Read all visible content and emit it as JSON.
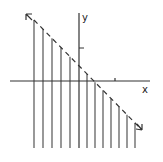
{
  "figure": {
    "type": "inequality-graph",
    "x_axis_label": "x",
    "y_axis_label": "y",
    "boundary": {
      "style": "dashed",
      "slope": -1,
      "arrows": "both ends"
    },
    "shading": "below line (vertical hatching)",
    "ticks": {
      "x": [
        1
      ],
      "y": [
        1
      ]
    },
    "colors": {
      "ink": "#333333",
      "background": "#ffffff"
    }
  },
  "geometry": {
    "origin_px": [
      79,
      81
    ],
    "line_start_px": [
      34,
      20
    ],
    "line_end_px": [
      140,
      128
    ],
    "hatch_x_px": [
      34,
      43,
      52,
      61,
      70,
      87,
      95,
      103,
      111,
      119,
      127,
      135
    ],
    "hatch_bottom_px": 148
  }
}
